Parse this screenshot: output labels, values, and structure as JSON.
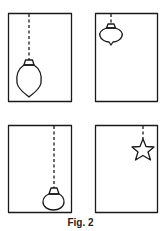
{
  "figure": {
    "caption": "Fig. 2",
    "stroke_color": "#1a1a1a",
    "panels": [
      {
        "id": "top-left",
        "ornament": "teardrop-bauble",
        "position": "bottom-left",
        "string": "long"
      },
      {
        "id": "top-right",
        "ornament": "onion-bauble",
        "position": "top-left",
        "string": "short"
      },
      {
        "id": "bottom-left",
        "ornament": "round-bauble",
        "position": "bottom-right",
        "string": "long"
      },
      {
        "id": "bottom-right",
        "ornament": "star",
        "position": "top-right",
        "string": "short"
      }
    ]
  }
}
